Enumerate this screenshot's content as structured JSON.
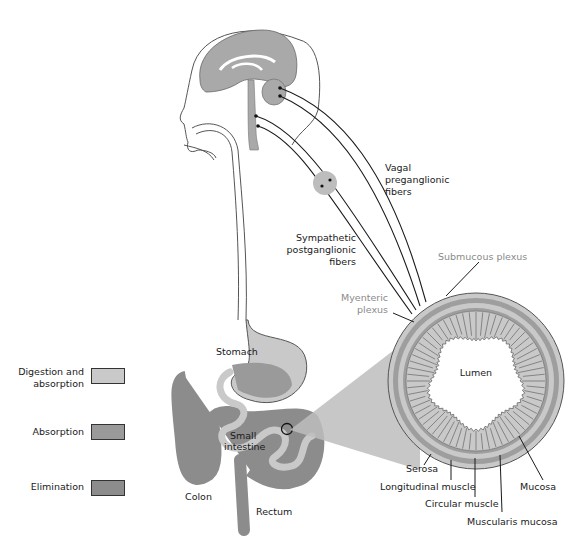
{
  "figure": {
    "labels": {
      "vagal": [
        "Vagal",
        "preganglionic",
        "fibers"
      ],
      "sympathetic": [
        "Sympathetic",
        "postganglionic",
        "fibers"
      ],
      "submucous_plexus": "Submucous plexus",
      "myenteric_plexus": [
        "Myenteric",
        "plexus"
      ],
      "lumen": "Lumen",
      "stomach": "Stomach",
      "small_intestine": [
        "Small",
        "intestine"
      ],
      "colon": "Colon",
      "rectum": "Rectum",
      "serosa": "Serosa",
      "longitudinal_muscle": "Longitudinal muscle",
      "circular_muscle": "Circular muscle",
      "muscularis_mucosa": "Muscularis mucosa",
      "mucosa": "Mucosa"
    },
    "legend": [
      {
        "label_lines": [
          "Digestion and",
          "absorption"
        ],
        "color": "#c9c9c9"
      },
      {
        "label_lines": [
          "Absorption"
        ],
        "color": "#9a9a9a"
      },
      {
        "label_lines": [
          "Elimination"
        ],
        "color": "#8c8c8c"
      }
    ],
    "colors": {
      "tissue_light": "#c8c8c8",
      "tissue_mid": "#9e9e9e",
      "tissue_dark": "#8a8a8a",
      "outline": "#2a2a2a",
      "label_gray": "#8a8a8a"
    }
  }
}
